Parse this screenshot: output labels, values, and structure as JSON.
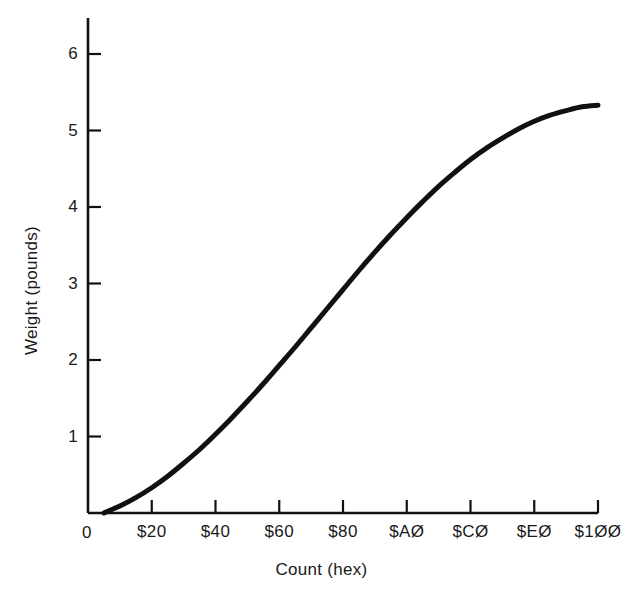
{
  "chart_data": {
    "type": "line",
    "title": "",
    "subtitle": "",
    "xlabel": "Count (hex)",
    "ylabel": "Weight (pounds)",
    "xlim": [
      0,
      256
    ],
    "ylim": [
      0,
      6.4
    ],
    "grid": false,
    "legend": null,
    "annotations": [],
    "x_tick_labels": [
      "0",
      "$20",
      "$40",
      "$60",
      "$80",
      "$AØ",
      "$CØ",
      "$EØ",
      "$1ØØ"
    ],
    "x_tick_values": [
      0,
      32,
      64,
      96,
      128,
      160,
      192,
      224,
      256
    ],
    "y_tick_labels": [
      "1",
      "2",
      "3",
      "4",
      "5",
      "6"
    ],
    "y_tick_values": [
      1,
      2,
      3,
      4,
      5,
      6
    ],
    "origin_label": "0",
    "series": [
      {
        "name": "Weight vs Count",
        "color": "#111111",
        "line_width": 5,
        "x": [
          8,
          16,
          24,
          32,
          40,
          48,
          56,
          64,
          72,
          80,
          88,
          96,
          104,
          112,
          120,
          128,
          136,
          144,
          152,
          160,
          168,
          176,
          184,
          192,
          200,
          208,
          216,
          224,
          232,
          240,
          248,
          256
        ],
        "y": [
          0.0,
          0.09,
          0.2,
          0.33,
          0.48,
          0.65,
          0.83,
          1.03,
          1.24,
          1.46,
          1.69,
          1.93,
          2.17,
          2.42,
          2.67,
          2.92,
          3.17,
          3.41,
          3.64,
          3.86,
          4.07,
          4.27,
          4.45,
          4.62,
          4.77,
          4.9,
          5.02,
          5.12,
          5.2,
          5.26,
          5.31,
          5.33
        ]
      }
    ]
  },
  "axes": {
    "x_title": "Count (hex)",
    "y_title": "Weight (pounds)",
    "origin_label": "0"
  },
  "ticks": {
    "x": [
      {
        "label": "$20",
        "value": 32
      },
      {
        "label": "$40",
        "value": 64
      },
      {
        "label": "$60",
        "value": 96
      },
      {
        "label": "$80",
        "value": 128
      },
      {
        "label": "$AØ",
        "value": 160
      },
      {
        "label": "$CØ",
        "value": 192
      },
      {
        "label": "$EØ",
        "value": 224
      },
      {
        "label": "$1ØØ",
        "value": 256
      }
    ],
    "y": [
      {
        "label": "1",
        "value": 1
      },
      {
        "label": "2",
        "value": 2
      },
      {
        "label": "3",
        "value": 3
      },
      {
        "label": "4",
        "value": 4
      },
      {
        "label": "5",
        "value": 5
      },
      {
        "label": "6",
        "value": 6
      }
    ]
  },
  "colors": {
    "background": "#ffffff",
    "axis": "#111111",
    "curve": "#111111",
    "text": "#1a1a1a"
  }
}
